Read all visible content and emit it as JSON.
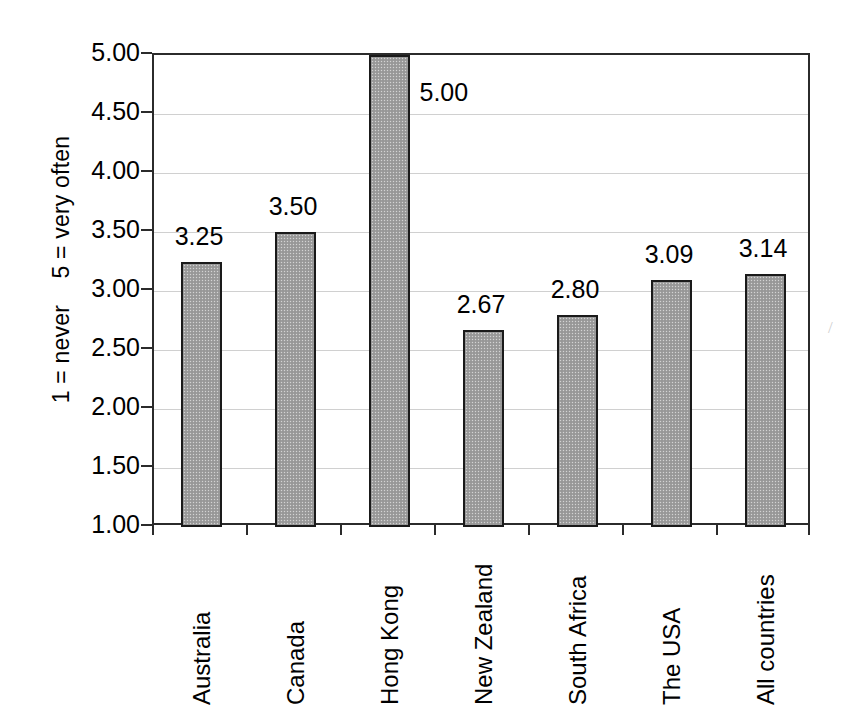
{
  "chart_data": {
    "type": "bar",
    "title": "",
    "subtitle": "",
    "xlabel": "",
    "ylabel": "1 = never    5 = very often",
    "categories": [
      "Australia",
      "Canada",
      "Hong Kong",
      "New Zealand",
      "South Africa",
      "The USA",
      "All countries"
    ],
    "values": [
      3.25,
      3.5,
      5.0,
      2.67,
      2.8,
      3.09,
      3.14
    ],
    "data_labels": [
      "3.25",
      "3.50",
      "5.00",
      "2.67",
      "2.80",
      "3.09",
      "3.14"
    ],
    "ylim": [
      1.0,
      5.0
    ],
    "ytick_values": [
      5.0,
      4.5,
      4.0,
      3.5,
      3.0,
      2.5,
      2.0,
      1.5,
      1.0
    ],
    "ytick_labels": [
      "5.00",
      "4.50",
      "4.00",
      "3.50",
      "3.00",
      "2.50",
      "2.00",
      "1.50",
      "1.00"
    ],
    "grid": true,
    "legend": false,
    "legend_position": "none",
    "series": [
      {
        "name": "",
        "values": [
          3.25,
          3.5,
          5.0,
          2.67,
          2.8,
          3.09,
          3.14
        ]
      }
    ],
    "colors": {
      "bar_fill": "#9e9e9e",
      "bar_border": "#1a1a1a",
      "gridline": "#d0d0d0",
      "axis": "#2b2b2b",
      "text": "#000000",
      "background": "#ffffff"
    }
  },
  "artifact": {
    "mark": "/"
  }
}
